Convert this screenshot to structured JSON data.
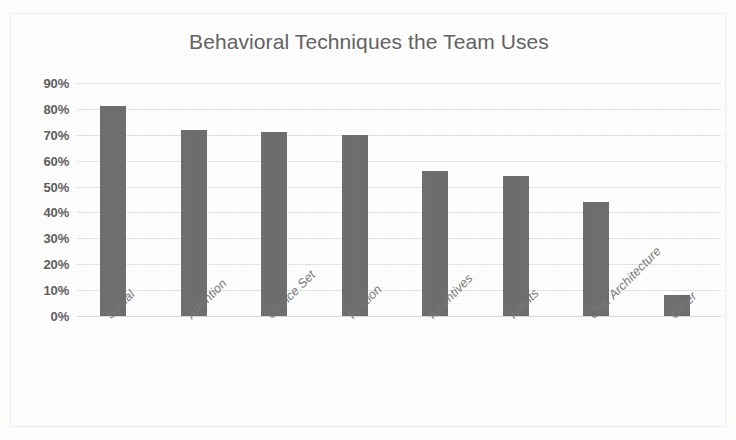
{
  "chart_data": {
    "type": "bar",
    "title": "Behavioral Techniques the Team Uses",
    "xlabel": "",
    "ylabel": "",
    "categories": [
      "Social",
      "Attention",
      "Choice Set",
      "Friction",
      "Incentives",
      "Habits",
      "Org. Architecture",
      "Other"
    ],
    "values": [
      81,
      72,
      71,
      70,
      56,
      54,
      44,
      8
    ],
    "value_labels": [
      "81%",
      "72%",
      "71%",
      "70%",
      "56%",
      "54%",
      "44%",
      "8%"
    ],
    "ylim": [
      0,
      90
    ],
    "y_tick_labels": [
      "90%",
      "80%",
      "70%",
      "60%",
      "50%",
      "40%",
      "30%",
      "20%",
      "10%",
      "0%"
    ],
    "y_tick_values": [
      90,
      80,
      70,
      60,
      50,
      40,
      30,
      20,
      10,
      0
    ],
    "grid": true,
    "grid_axis": "y",
    "legend": false,
    "legend_position": "none",
    "series": [
      {
        "name": "Percent of Team Using Technique",
        "values": [
          81,
          72,
          71,
          70,
          56,
          54,
          44,
          8
        ],
        "color": "#6e6e6e"
      }
    ]
  },
  "style": {
    "bar_color": "#6e6e6e",
    "title_color": "#636363",
    "tick_color": "#5e5e5e",
    "x_tick_color": "#787878",
    "gridline_color": "#e3e3e3",
    "frame_color": "#ececec",
    "background": "#fdfdfc"
  }
}
